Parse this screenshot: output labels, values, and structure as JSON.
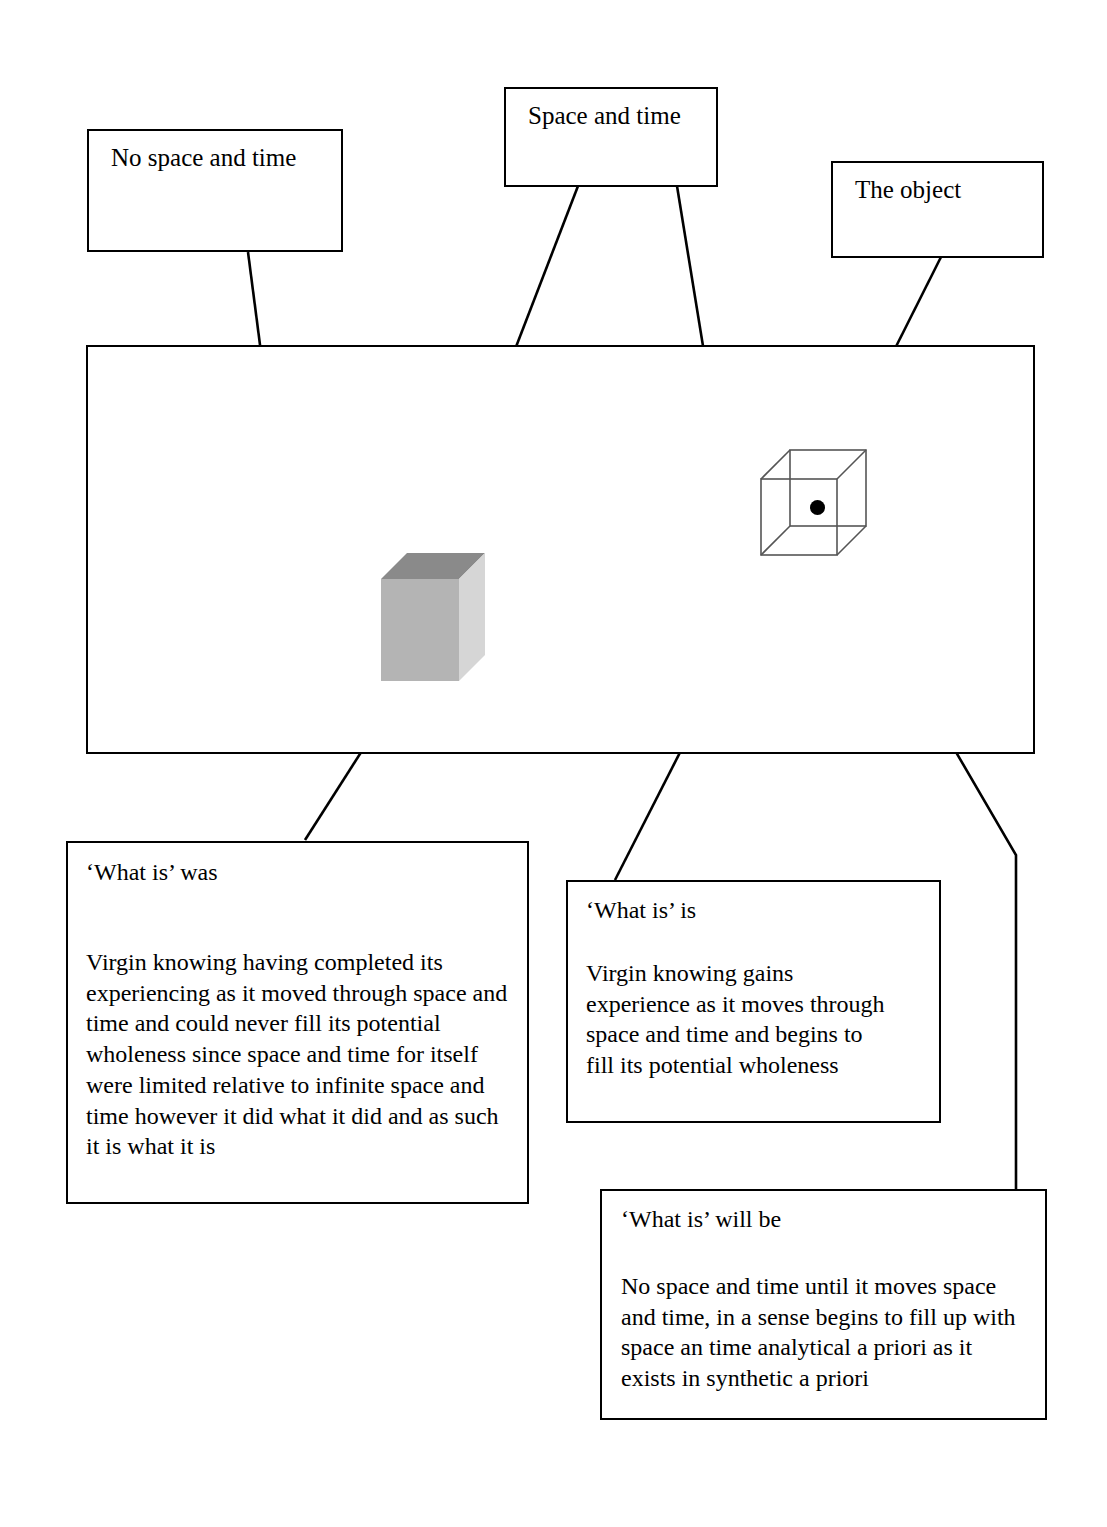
{
  "diagram": {
    "title_boxes": [
      {
        "id": "no-space-and-time",
        "label": "No space and time"
      },
      {
        "id": "space-and-time",
        "label": "Space and time"
      },
      {
        "id": "the-object",
        "label": "The object"
      }
    ],
    "note_boxes": [
      {
        "id": "what-is-was",
        "heading": "‘What is’ was",
        "body": "Virgin knowing having completed its experiencing as it moved through space and time and could never fill its potential wholeness since space and time for itself were limited relative to infinite space and time however it did what it did and as such it is what it is"
      },
      {
        "id": "what-is-is",
        "heading": "‘What is’ is",
        "body": "Virgin knowing gains experience as it moves through space and time and begins to fill its potential wholeness"
      },
      {
        "id": "what-is-will-be",
        "heading": "‘What is’ will be",
        "body": "No space and time until it moves space and time, in a sense begins to fill up with space an time analytical a priori as it exists in synthetic a priori"
      }
    ],
    "shapes": {
      "field_rect": "space-and-time-field-rectangle",
      "solid_cube": "solid-gray-cube",
      "wireframe_cube": "wireframe-cube",
      "circle": "circle-around-wireframe-cube",
      "center_dot": "center-point-dot"
    },
    "colors": {
      "stroke": "#000000",
      "background": "#ffffff",
      "cube_front": "#b3b3b3",
      "cube_top": "#8c8c8c",
      "cube_side": "#d4d4d4"
    },
    "connectors": [
      {
        "id": "no-space-to-field",
        "from": "no-space-and-time",
        "to": "field-rect-interior"
      },
      {
        "id": "space-time-to-solid-cube",
        "from": "space-and-time",
        "to": "solid-cube"
      },
      {
        "id": "space-time-to-circle",
        "from": "space-and-time",
        "to": "circle-edge"
      },
      {
        "id": "object-to-wire-cube",
        "from": "the-object",
        "to": "wireframe-cube"
      },
      {
        "id": "what-is-was-to-solid-cube",
        "from": "what-is-was",
        "to": "solid-cube"
      },
      {
        "id": "what-is-is-to-wire-cube",
        "from": "what-is-is",
        "to": "wireframe-cube"
      },
      {
        "id": "what-is-will-be-to-wire-cube",
        "from": "what-is-will-be",
        "to": "wireframe-cube"
      }
    ]
  }
}
